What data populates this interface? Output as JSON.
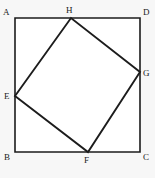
{
  "figure": {
    "type": "geometry-diagram",
    "background_color": "#f7f7f7",
    "fill_color": "#ffffff",
    "stroke_color": "#1c1c1c",
    "canvas": {
      "width": 155,
      "height": 178
    },
    "outer_square": {
      "name": "ABCD",
      "points": "15,18 140,18 140,152 15,152",
      "vertices": [
        {
          "id": "A",
          "x": 15,
          "y": 18
        },
        {
          "id": "D",
          "x": 140,
          "y": 18
        },
        {
          "id": "C",
          "x": 140,
          "y": 152
        },
        {
          "id": "B",
          "x": 15,
          "y": 152
        }
      ]
    },
    "inner_quad": {
      "name": "EFGH",
      "points": "15,96 88,152 140,72 71,18",
      "vertices": [
        {
          "id": "E",
          "x": 15,
          "y": 96,
          "on_side": "AB"
        },
        {
          "id": "F",
          "x": 88,
          "y": 152,
          "on_side": "BC"
        },
        {
          "id": "G",
          "x": 140,
          "y": 72,
          "on_side": "DC"
        },
        {
          "id": "H",
          "x": 71,
          "y": 18,
          "on_side": "AD"
        }
      ]
    },
    "labels": [
      {
        "id": "A",
        "text": "A",
        "left": 3,
        "top": 8
      },
      {
        "id": "H",
        "text": "H",
        "left": 66,
        "top": 6
      },
      {
        "id": "D",
        "text": "D",
        "left": 143,
        "top": 8
      },
      {
        "id": "G",
        "text": "G",
        "left": 143,
        "top": 69
      },
      {
        "id": "E",
        "text": "E",
        "left": 4,
        "top": 92
      },
      {
        "id": "B",
        "text": "B",
        "left": 4,
        "top": 153
      },
      {
        "id": "F",
        "text": "F",
        "left": 84,
        "top": 156
      },
      {
        "id": "C",
        "text": "C",
        "left": 143,
        "top": 153
      }
    ]
  }
}
